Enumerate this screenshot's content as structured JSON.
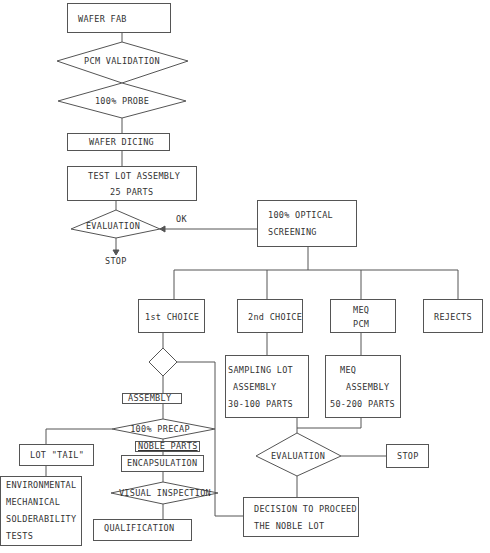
{
  "flowchart": {
    "wafer_fab": "WAFER FAB",
    "pcm_validation": "PCM VALIDATION",
    "probe": "100%  PROBE",
    "wafer_dicing": "WAFER DICING",
    "test_lot_line1": "TEST LOT ASSEMBLY",
    "test_lot_line2": "25 PARTS",
    "evaluation_1": "EVALUATION",
    "ok_label": "OK",
    "stop_1": "STOP",
    "optical_line1": "100% OPTICAL",
    "optical_line2": "SCREENING",
    "first_choice": "1st CHOICE",
    "second_choice": "2nd CHOICE",
    "meq_pcm_line1": "MEQ",
    "meq_pcm_line2": "PCM",
    "rejects": "REJECTS",
    "assembly": "ASSEMBLY",
    "precap": "100% PRECAP",
    "noble_parts": "NOBLE PARTS",
    "encapsulation": "ENCAPSULATION",
    "visual_inspection": "VISUAL INSPECTION",
    "qualification": "QUALIFICATION",
    "lot_tail": "LOT \"TAIL\"",
    "env_line1": "ENVIRONMENTAL",
    "env_line2": "MECHANICAL",
    "env_line3": "SOLDERABILITY",
    "env_line4": "TESTS",
    "sampling_line1": "SAMPLING LOT",
    "sampling_line2": "ASSEMBLY",
    "sampling_line3": "30-100 PARTS",
    "meq_asm_line1": "MEQ",
    "meq_asm_line2": "ASSEMBLY",
    "meq_asm_line3": "50-200 PARTS",
    "evaluation_2": "EVALUATION",
    "stop_2": "STOP",
    "decision_line1": "DECISION TO PROCEED",
    "decision_line2": "THE NOBLE LOT"
  },
  "colors": {
    "line": "#555555",
    "text": "#333333",
    "background": "#ffffff"
  }
}
